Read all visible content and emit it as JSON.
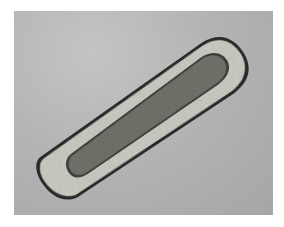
{
  "image": {
    "description": "Grayscale brightfield micrograph of an elongated, club-shaped organism/cell with a granular translucent outer layer and a darker textured interior core, oriented diagonally from lower-left to upper-right on a gray background",
    "colors": {
      "page_background": "#ffffff",
      "photo_background": "#b2b2b2",
      "outer_layer": "#cfcfc7",
      "outline": "#2a2a2a",
      "inner_core": "#6a6a66"
    }
  }
}
